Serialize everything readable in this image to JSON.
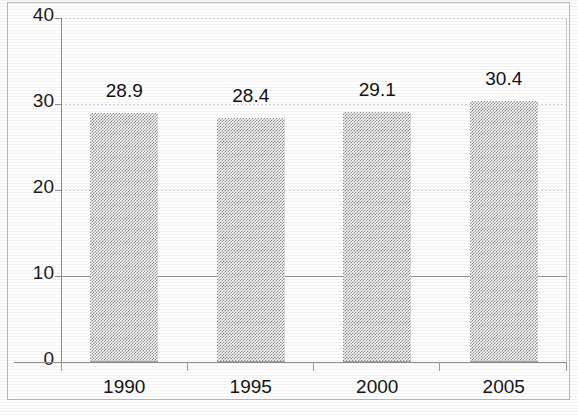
{
  "chart_data": {
    "type": "bar",
    "title": "",
    "xlabel": "",
    "ylabel": "",
    "categories": [
      "1990",
      "1995",
      "2000",
      "2005"
    ],
    "values": [
      28.9,
      28.4,
      29.1,
      30.4
    ],
    "value_labels": [
      "28.9",
      "28.4",
      "29.1",
      "30.4"
    ],
    "ylim": [
      0,
      40
    ],
    "yticks": [
      0,
      10,
      20,
      30,
      40
    ],
    "ytick_labels": [
      "0",
      "10",
      "20",
      "30",
      "40"
    ],
    "grid": true,
    "legend": "none",
    "series": [
      {
        "name": "",
        "values": [
          28.9,
          28.4,
          29.1,
          30.4
        ]
      }
    ],
    "colors": {
      "bar_fill": "#8f8f8f",
      "bar_background": "#ffffff",
      "axis": "#8c8c8c",
      "gridline": "#cfcfcf",
      "text": "#151515",
      "frame": "#b9b9b9"
    }
  }
}
